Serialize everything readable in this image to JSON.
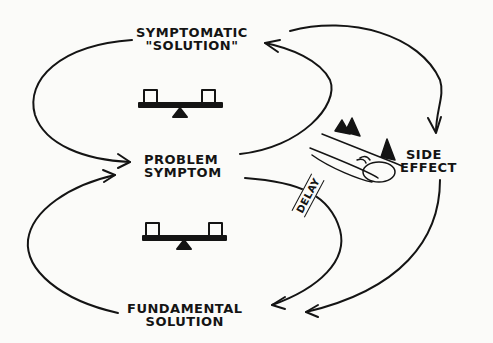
{
  "diagram": {
    "nodes": {
      "symptomatic_solution": {
        "line1": "SYMPTOMATIC",
        "line2": "\"SOLUTION\""
      },
      "problem_symptom": {
        "line1": "PROBLEM",
        "line2": "SYMPTOM"
      },
      "fundamental_solution": {
        "line1": "FUNDAMENTAL",
        "line2": "SOLUTION"
      },
      "side_effect": {
        "line1": "SIDE",
        "line2": "EFFECT"
      }
    },
    "delay_label": "DELAY",
    "loops": [
      {
        "name": "upper-balancing-loop",
        "type": "balancing",
        "icon": "seesaw-icon"
      },
      {
        "name": "lower-balancing-loop",
        "type": "balancing",
        "icon": "seesaw-icon"
      }
    ],
    "links": [
      {
        "from": "SYMPTOMATIC \"SOLUTION\"",
        "to": "PROBLEM SYMPTOM"
      },
      {
        "from": "PROBLEM SYMPTOM",
        "to": "SYMPTOMATIC \"SOLUTION\""
      },
      {
        "from": "SYMPTOMATIC \"SOLUTION\"",
        "to": "SIDE EFFECT"
      },
      {
        "from": "SIDE EFFECT",
        "to": "FUNDAMENTAL SOLUTION"
      },
      {
        "from": "PROBLEM SYMPTOM",
        "to": "FUNDAMENTAL SOLUTION",
        "delay": true
      },
      {
        "from": "FUNDAMENTAL SOLUTION",
        "to": "PROBLEM SYMPTOM"
      }
    ],
    "colors": {
      "ink": "#141414",
      "paper": "#fbfbf9"
    }
  }
}
